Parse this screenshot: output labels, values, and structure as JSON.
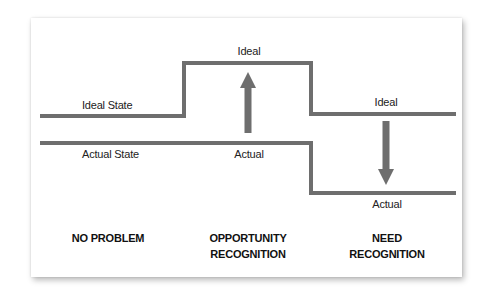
{
  "colors": {
    "line": "#6e6e6e",
    "arrow": "#6e6e6e",
    "background": "#ffffff",
    "text": "#222222"
  },
  "labels": {
    "ideal_state": "Ideal State",
    "actual_state": "Actual State",
    "ideal_opportunity": "Ideal",
    "actual_opportunity": "Actual",
    "ideal_need": "Ideal",
    "actual_need": "Actual"
  },
  "categories": {
    "no_problem": "NO PROBLEM",
    "opportunity_line1": "OPPORTUNITY",
    "opportunity_line2": "RECOGNITION",
    "need_line1": "NEED",
    "need_line2": "RECOGNITION"
  },
  "arrows": [
    {
      "name": "up-arrow",
      "direction": "up",
      "section": "opportunity recognition"
    },
    {
      "name": "down-arrow",
      "direction": "down",
      "section": "need recognition"
    }
  ]
}
